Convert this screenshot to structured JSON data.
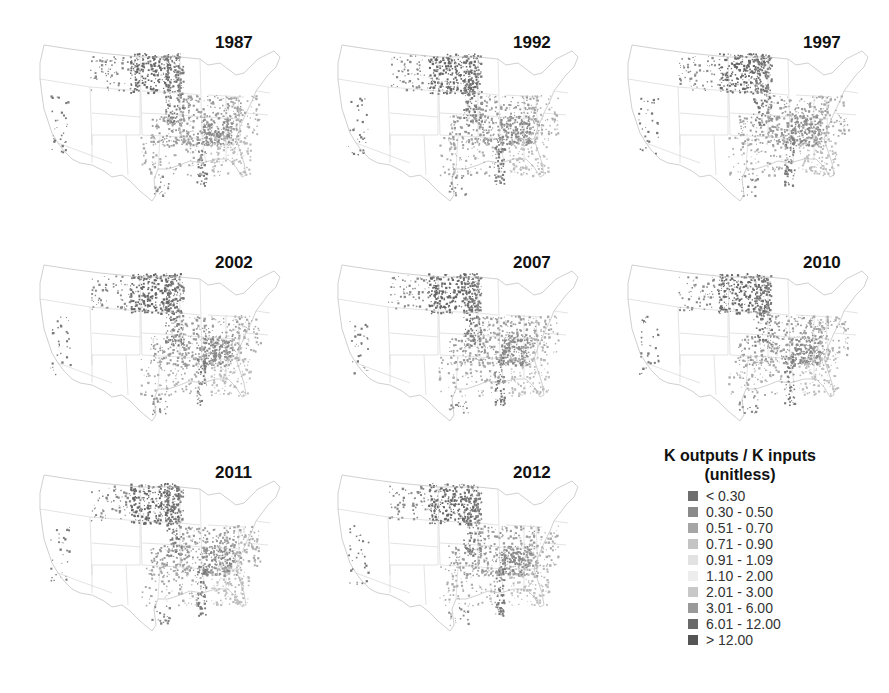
{
  "panels": [
    {
      "year": "1987",
      "left": 30,
      "top": 35
    },
    {
      "year": "1992",
      "left": 328,
      "top": 35
    },
    {
      "year": "1997",
      "left": 618,
      "top": 35
    },
    {
      "year": "2002",
      "left": 30,
      "top": 255
    },
    {
      "year": "2007",
      "left": 328,
      "top": 255
    },
    {
      "year": "2010",
      "left": 618,
      "top": 255
    },
    {
      "year": "2011",
      "left": 30,
      "top": 465
    },
    {
      "year": "2012",
      "left": 328,
      "top": 465
    }
  ],
  "legend": {
    "title_line1": "K outputs / K inputs",
    "title_line2": "(unitless)",
    "items": [
      {
        "label": "< 0.30",
        "color": "#6e6e6e"
      },
      {
        "label": "0.30 - 0.50",
        "color": "#8a8a8a"
      },
      {
        "label": "0.51 - 0.70",
        "color": "#a6a6a6"
      },
      {
        "label": "0.71 - 0.90",
        "color": "#c4c4c4"
      },
      {
        "label": "0.91 - 1.09",
        "color": "#e2e2e2"
      },
      {
        "label": "1.10 - 2.00",
        "color": "#ededed"
      },
      {
        "label": "2.01 - 3.00",
        "color": "#c8c8c8"
      },
      {
        "label": "3.01 - 6.00",
        "color": "#9a9a9a"
      },
      {
        "label": "6.01 - 12.00",
        "color": "#6a6a6a"
      },
      {
        "label": "> 12.00",
        "color": "#555555"
      }
    ]
  }
}
